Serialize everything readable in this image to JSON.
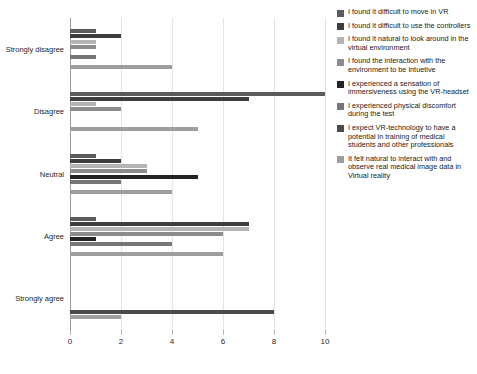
{
  "chart_data": {
    "type": "bar",
    "orientation": "horizontal",
    "title": "",
    "subtitle": "",
    "xlabel": "",
    "ylabel": "",
    "xlim": [
      0,
      10
    ],
    "xticks": [
      0,
      2,
      4,
      6,
      8,
      10
    ],
    "xtick_labels": [
      "0",
      "2",
      "4",
      "6",
      "8",
      "10"
    ],
    "grid": true,
    "grid_axis": "x",
    "legend_position": "right",
    "categories": [
      "Strongly disagree",
      "Disagree",
      "Neutral",
      "Agree",
      "Strongly agree"
    ],
    "series": [
      {
        "name": "I found it difficult to move in VR",
        "color": "#5b5b5b",
        "values": [
          1,
          10,
          1,
          1,
          0
        ]
      },
      {
        "name": "I found it difficult to use the controllers",
        "color": "#3d3d3d",
        "values": [
          2,
          7,
          2,
          7,
          0
        ]
      },
      {
        "name": "I found it natural to look around in the virtual environment",
        "color": "#b4b4b4",
        "values": [
          1,
          1,
          3,
          7,
          0
        ]
      },
      {
        "name": "I found the interaction with the environment to be intuetive",
        "color": "#8c8c8c",
        "values": [
          1,
          2,
          3,
          6,
          0
        ]
      },
      {
        "name": "I experienced a sensation of immersiveness using the VR-headset",
        "color": "#242424",
        "values": [
          0,
          0,
          5,
          1,
          0
        ]
      },
      {
        "name": "I experienced physical discomfort during the test",
        "color": "#767676",
        "values": [
          1,
          0,
          2,
          4,
          0
        ]
      },
      {
        "name": "I expect VR-technology to have a potential in training of medical students and other professionals",
        "color": "#4a4a4a",
        "values": [
          0,
          0,
          0,
          0,
          8
        ]
      },
      {
        "name": "It felt natural to interact with and observe real medical image data in Virtual reality",
        "color": "#9e9e9e",
        "values": [
          4,
          5,
          4,
          6,
          2
        ]
      }
    ]
  }
}
